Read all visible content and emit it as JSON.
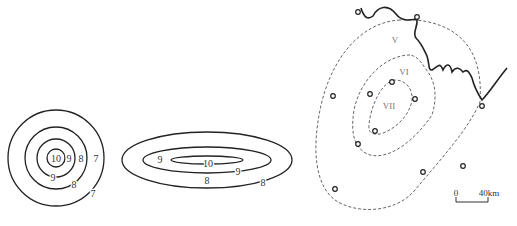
{
  "circles_figure": {
    "center": [
      56,
      158
    ],
    "rings": [
      {
        "value": "10",
        "r": 9
      },
      {
        "value": "9",
        "r": 19
      },
      {
        "value": "8",
        "r": 31
      },
      {
        "value": "7",
        "r": 48
      }
    ],
    "labels": [
      {
        "text": "10",
        "x": 56,
        "y": 162
      },
      {
        "text": "9",
        "x": 69,
        "y": 162
      },
      {
        "text": "8",
        "x": 81,
        "y": 162
      },
      {
        "text": "7",
        "x": 96,
        "y": 162
      },
      {
        "text": "9",
        "x": 53,
        "y": 181
      },
      {
        "text": "8",
        "x": 74,
        "y": 188
      },
      {
        "text": "7",
        "x": 93,
        "y": 197
      }
    ]
  },
  "ellipses_figure": {
    "center": [
      207,
      160
    ],
    "rings": [
      {
        "value": "10",
        "rx": 36,
        "ry": 4
      },
      {
        "value": "9",
        "rx": 64,
        "ry": 13
      },
      {
        "value": "8",
        "rx": 85,
        "ry": 28
      }
    ],
    "labels": [
      {
        "text": "9",
        "x": 160,
        "y": 163
      },
      {
        "text": "10",
        "x": 208,
        "y": 167
      },
      {
        "text": "9",
        "x": 238,
        "y": 175
      },
      {
        "text": "8",
        "x": 207,
        "y": 184
      },
      {
        "text": "8",
        "x": 263,
        "y": 186
      }
    ]
  },
  "isoseismal_map": {
    "intensity_zones": [
      {
        "label": "V",
        "x": 395,
        "y": 43
      },
      {
        "label": "VI",
        "x": 404,
        "y": 75
      },
      {
        "label": "VII",
        "x": 389,
        "y": 109
      }
    ],
    "stations": [
      [
        358,
        12
      ],
      [
        417,
        17
      ],
      [
        333,
        96
      ],
      [
        370,
        94
      ],
      [
        392,
        82
      ],
      [
        415,
        99
      ],
      [
        375,
        131
      ],
      [
        358,
        144
      ],
      [
        482,
        106
      ],
      [
        463,
        166
      ],
      [
        423,
        172
      ],
      [
        335,
        189
      ]
    ],
    "scale_bar": {
      "start_label": "0",
      "end_label": "40km"
    }
  }
}
